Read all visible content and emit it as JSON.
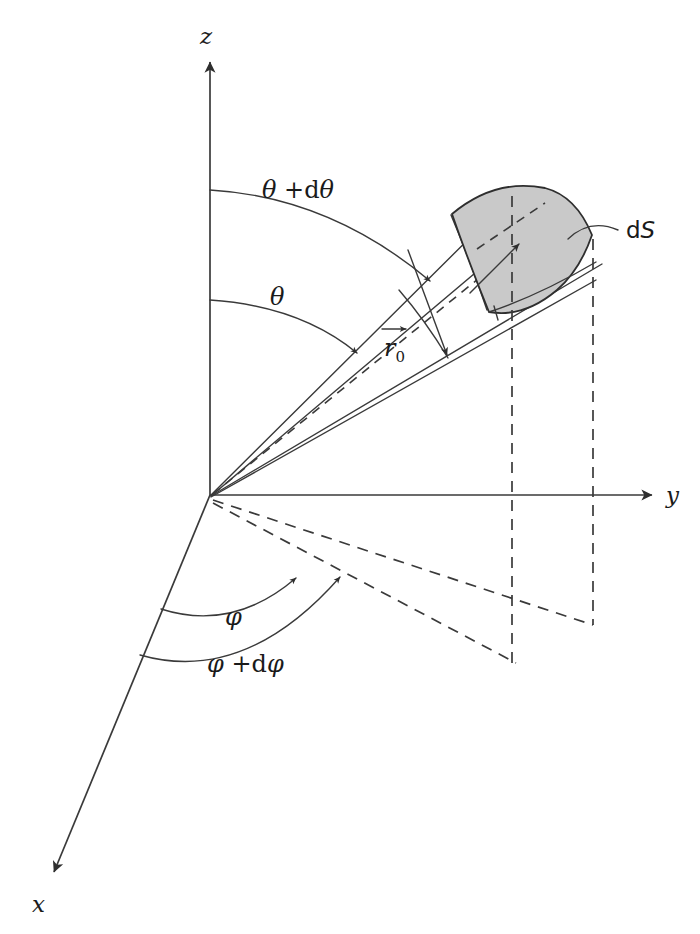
{
  "figure": {
    "kind": "spherical-coordinates-solid-angle-diagram",
    "background_color": "#ffffff",
    "line_color": "#3a3a3a",
    "patch_fill_color": "#c9c9c9",
    "patch_stroke_color": "#2e2e2e"
  },
  "axes": [
    {
      "name": "z-axis",
      "label": "z",
      "direction": "up",
      "label_x": 205,
      "label_y": 40
    },
    {
      "name": "y-axis",
      "label": "y",
      "direction": "right",
      "label_x": 668,
      "label_y": 502
    },
    {
      "name": "x-axis",
      "label": "x",
      "direction": "down-left",
      "label_x": 34,
      "label_y": 912
    }
  ],
  "origin": {
    "x": 210,
    "y": 495
  },
  "labels": {
    "theta": "θ",
    "theta_plus_dtheta_first": "θ",
    "theta_plus_dtheta_op": " +",
    "theta_plus_dtheta_d": "d",
    "theta_plus_dtheta_second": "θ",
    "phi": "φ",
    "phi_plus_dphi_first": "φ",
    "phi_plus_dphi_op": " +",
    "phi_plus_dphi_d": "d",
    "phi_plus_dphi_second": "φ",
    "r_vector": "r",
    "r_subscript": "0",
    "ds_d": "d",
    "ds_s": "S"
  },
  "annotations": [
    {
      "name": "theta-arc",
      "text": "θ",
      "x": 278,
      "y": 300,
      "describes": "polar angle from z-axis to lower cone edge"
    },
    {
      "name": "theta-plus-dtheta-arc",
      "text": "θ +dθ",
      "x": 283,
      "y": 192,
      "describes": "polar angle from z-axis to upper cone edge"
    },
    {
      "name": "phi-arc",
      "text": "φ",
      "x": 232,
      "y": 617,
      "describes": "azimuthal angle from x-axis in xy-plane"
    },
    {
      "name": "phi-plus-dphi-arc",
      "text": "φ +dφ",
      "x": 212,
      "y": 662,
      "describes": "azimuthal angle plus increment"
    },
    {
      "name": "r-zero-vector",
      "text": "r⃗0",
      "x": 385,
      "y": 350,
      "describes": "radius vector to inner arc"
    },
    {
      "name": "ds-label",
      "text": "dS",
      "x": 630,
      "y": 236,
      "describes": "differential surface element, shaded patch"
    }
  ]
}
